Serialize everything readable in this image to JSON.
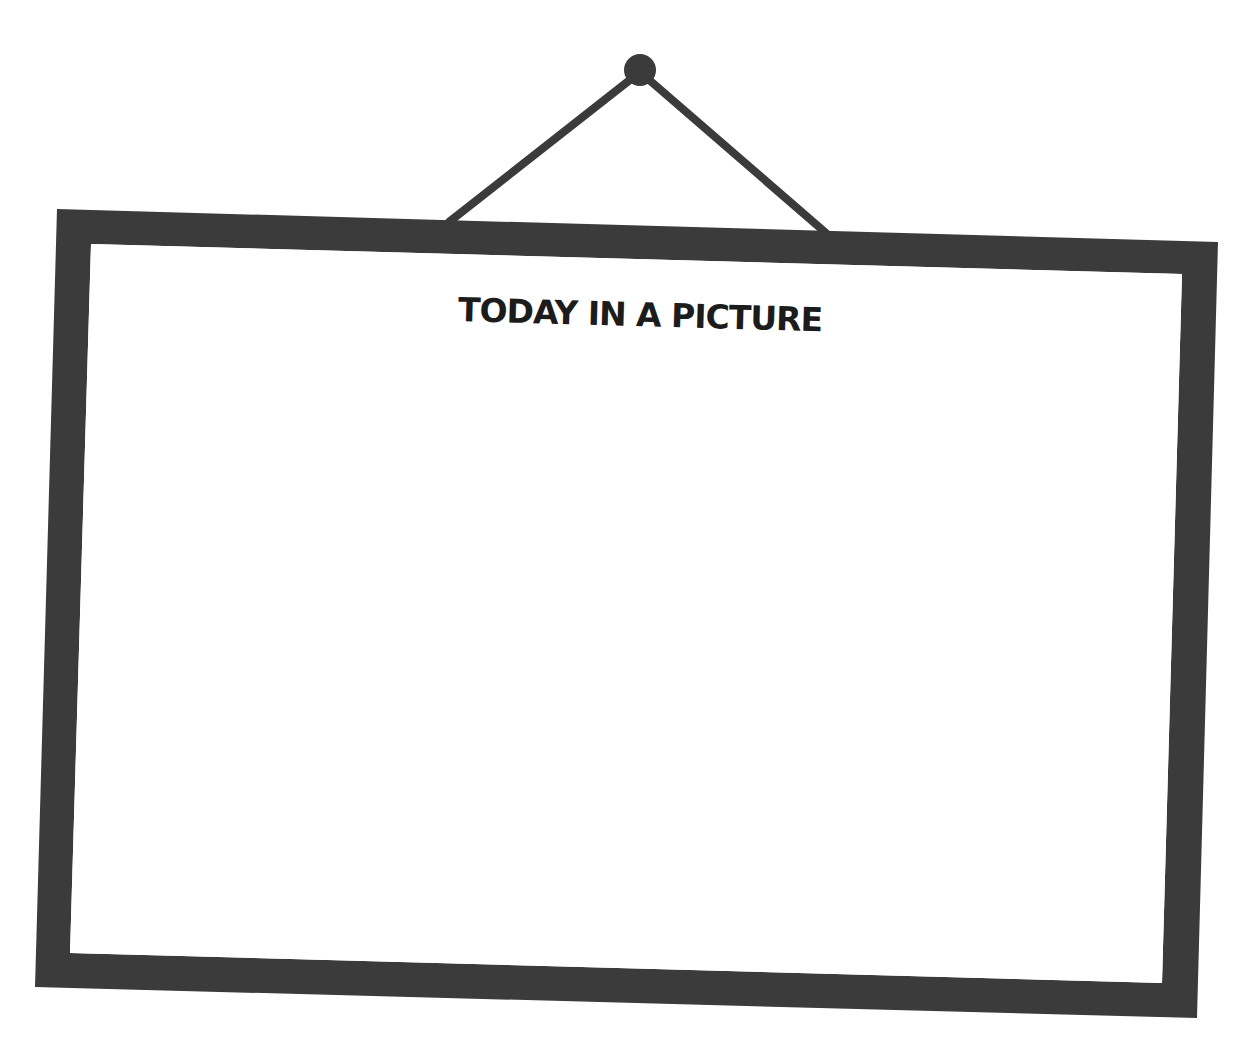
{
  "worksheet": {
    "title": "TODAY IN A PICTURE",
    "drawing_area": {
      "content": ""
    }
  },
  "colors": {
    "frame": "#3b3b3b",
    "string": "#3b3b3b",
    "nail": "#3b3b3b",
    "paper": "#ffffff",
    "title_text": "#1c1c1c"
  },
  "icons": {
    "nail": "nail-icon",
    "string": "hanging-string"
  }
}
